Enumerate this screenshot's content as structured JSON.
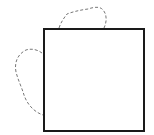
{
  "diagram": {
    "shapes": [
      {
        "id": "square",
        "kind": "rectangle",
        "style": "solid"
      },
      {
        "id": "top-lobe",
        "kind": "freeform-curve",
        "style": "dashed",
        "attached_to": "top edge"
      },
      {
        "id": "left-lobe",
        "kind": "freeform-curve",
        "style": "dashed",
        "attached_to": "left edge"
      }
    ],
    "colors": {
      "stroke": "#1a1a1a",
      "dashed_stroke": "#777777",
      "background": "#ffffff"
    }
  }
}
